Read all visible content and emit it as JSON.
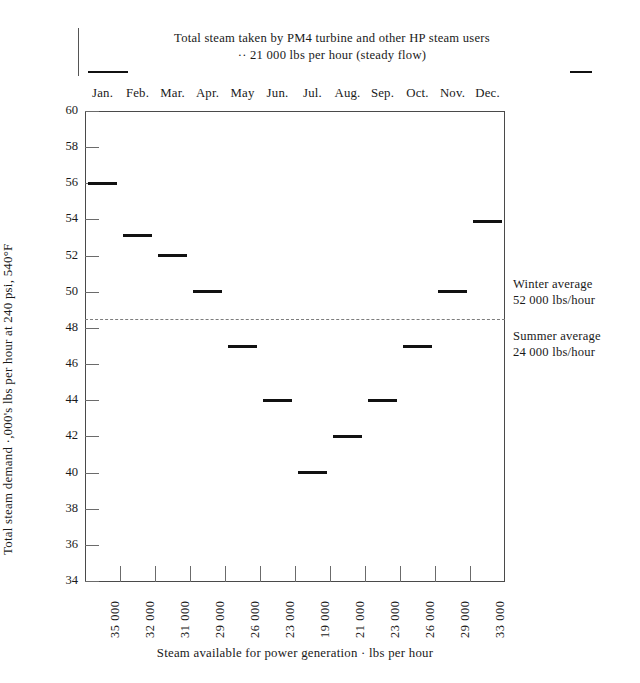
{
  "header": {
    "title": "Total steam taken by PM4 turbine and other HP steam users",
    "subtitle": "·· 21 000 lbs per hour (steady flow)"
  },
  "annotations": {
    "winter_line1": "Winter average",
    "winter_line2": "52 000 lbs/hour",
    "summer_line1": "Summer average",
    "summer_line2": "24 000 lbs/hour"
  },
  "chart_data": {
    "type": "bar",
    "title": "Total steam taken by PM4 turbine and other HP steam users ·· 21 000 lbs per hour (steady flow)",
    "xlabel": "Steam available for power generation · lbs per hour",
    "ylabel": "Total steam demand ·,000's lbs per hour at 240 psi, 540°F",
    "ylim": [
      34,
      60
    ],
    "yticks": [
      34,
      36,
      38,
      40,
      42,
      44,
      46,
      48,
      50,
      52,
      54,
      56,
      58,
      60
    ],
    "ytick_labels": [
      "34",
      "36",
      "38",
      "40",
      "42",
      "44",
      "46",
      "48",
      "50",
      "52",
      "54",
      "56",
      "58",
      "60"
    ],
    "grid": false,
    "legend_position": "right-inline-annotation",
    "categories": [
      "Jan.",
      "Feb.",
      "Mar.",
      "Apr.",
      "May",
      "Jun.",
      "Jul.",
      "Aug.",
      "Sep.",
      "Oct.",
      "Nov.",
      "Dec."
    ],
    "secondary_axis_labels": [
      "35 000",
      "32 000",
      "31 000",
      "29 000",
      "26 000",
      "23 000",
      "19 000",
      "21 000",
      "23 000",
      "26 000",
      "29 000",
      "33 000"
    ],
    "secondary_axis_name": "Steam available for power generation · lbs per hour",
    "values": [
      56.0,
      53.1,
      52.0,
      50.0,
      47.0,
      44.0,
      40.0,
      42.0,
      44.0,
      47.0,
      50.0,
      53.9
    ],
    "reference_lines": [
      {
        "label": "Summer average / Winter average divider",
        "value": 48.5,
        "style": "dashed"
      }
    ],
    "annotations": [
      {
        "text": "Winter average 52 000 lbs/hour",
        "value": 52
      },
      {
        "text": "Summer average 24 000 lbs/hour",
        "value": 24
      }
    ]
  }
}
